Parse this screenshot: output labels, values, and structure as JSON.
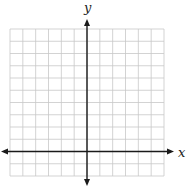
{
  "chart_data": {
    "type": "line",
    "title": "",
    "xlabel": "x",
    "ylabel": "y",
    "xlim": [
      -6,
      6
    ],
    "ylim": [
      -2,
      10
    ],
    "grid": true,
    "grid_step": 1,
    "tick_labels": false,
    "series": [],
    "axes_arrows": true
  },
  "labels": {
    "x_axis": "x",
    "y_axis": "y"
  }
}
